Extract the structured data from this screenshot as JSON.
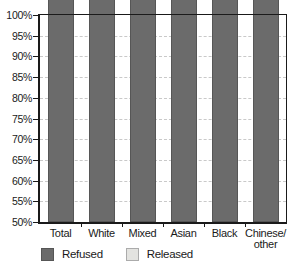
{
  "chart_data": {
    "type": "bar",
    "stacked": true,
    "categories": [
      "Total",
      "White",
      "Mixed",
      "Asian",
      "Black",
      "Chinese/\nother"
    ],
    "series": [
      {
        "name": "Refused",
        "color": "#6b6b6b",
        "border": "#565656",
        "values": [
          89,
          89,
          94,
          86,
          92,
          92
        ]
      },
      {
        "name": "Released",
        "color": "#e3e3e0",
        "border": "#ababab",
        "values": [
          11,
          11,
          6,
          14,
          8,
          8
        ]
      }
    ],
    "ylim": [
      50,
      100
    ],
    "y_tick_step": 5,
    "y_tick_labels": [
      "100%",
      "95%",
      "90%",
      "85%",
      "80%",
      "75%",
      "70%",
      "65%",
      "60%",
      "55%",
      "50%"
    ],
    "grid": "horizontal-dashed",
    "legend_position": "bottom-left",
    "legend_labels": [
      "Refused",
      "Released"
    ]
  },
  "colors": {
    "refused": "#6b6b6b",
    "released": "#e3e3e0",
    "axis": "#1a1a1a",
    "gridline": "#c9c9c9",
    "background": "#ffffff"
  }
}
